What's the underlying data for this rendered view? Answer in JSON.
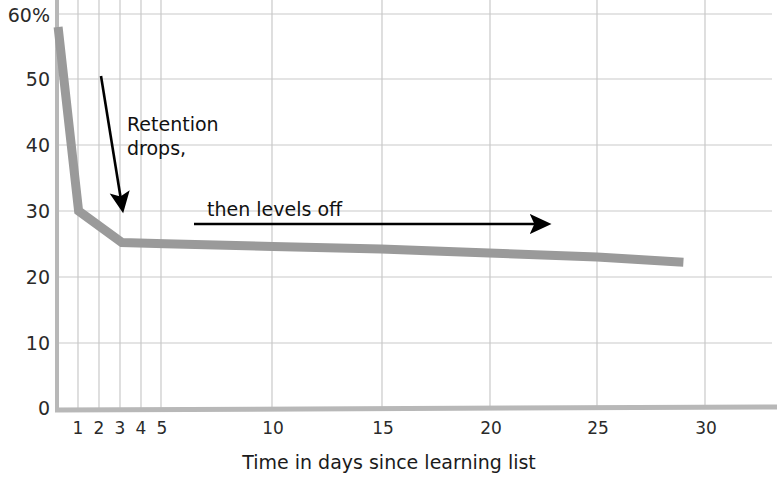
{
  "chart_data": {
    "type": "line",
    "title": "",
    "subtitle": "",
    "xlabel": "Time in days since learning list",
    "ylabel": "",
    "xlim": [
      0,
      31
    ],
    "ylim": [
      0,
      60
    ],
    "grid": true,
    "legend_position": "none",
    "x_tick_labels": [
      "1",
      "2",
      "3",
      "4",
      "5",
      "10",
      "15",
      "20",
      "25",
      "30"
    ],
    "x_ticks": [
      1,
      2,
      3,
      4,
      5,
      10,
      15,
      20,
      25,
      30
    ],
    "y_tick_labels": [
      "0",
      "10",
      "20",
      "30",
      "40",
      "50",
      "60%"
    ],
    "y_ticks": [
      0,
      10,
      20,
      30,
      40,
      50,
      60
    ],
    "series": [
      {
        "name": "Retention",
        "color": "#9a9a9a",
        "x": [
          0.05,
          1,
          3,
          5,
          10,
          15,
          20,
          25,
          29
        ],
        "values": [
          58,
          30,
          25.2,
          25,
          24.6,
          24.2,
          23.6,
          23,
          22.2
        ]
      }
    ],
    "annotations": [
      {
        "id": "retention-drops",
        "text_lines": [
          "Retention",
          "drops,"
        ],
        "arrow": "diagonal-down-right",
        "arrow_from": [
          1.25,
          50
        ],
        "arrow_to": [
          2.2,
          30
        ]
      },
      {
        "id": "then-levels-off",
        "text_lines": [
          "then levels off"
        ],
        "arrow": "horizontal-right",
        "arrow_from": [
          5.5,
          28.5
        ],
        "arrow_to": [
          21.5,
          28.5
        ]
      }
    ]
  },
  "axes": {
    "y_labels": {
      "v60": "60%",
      "v50": "50",
      "v40": "40",
      "v30": "30",
      "v20": "20",
      "v10": "10",
      "v0": "0"
    },
    "x_labels": {
      "d1": "1",
      "d2": "2",
      "d3": "3",
      "d4": "4",
      "d5": "5",
      "d10": "10",
      "d15": "15",
      "d20": "20",
      "d25": "25",
      "d30": "30"
    },
    "x_axis_title": "Time in days since learning list"
  },
  "annotations": {
    "drop_line1": "Retention",
    "drop_line2": "drops,",
    "levels_off": "then levels off"
  },
  "colors": {
    "curve": "#9a9a9a",
    "grid": "#c9c9c9",
    "axis": "#b3b3b3",
    "text": "#1b1b1b",
    "annotation_arrow": "#000000",
    "background": "#ffffff"
  }
}
